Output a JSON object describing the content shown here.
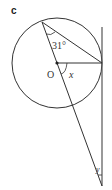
{
  "part_label": "c",
  "labels": {
    "angle_a": "31°",
    "center": "O",
    "angle_x": "x",
    "angle_y": "y"
  },
  "colors": {
    "stroke": "#333333",
    "background": "#ffffff"
  }
}
